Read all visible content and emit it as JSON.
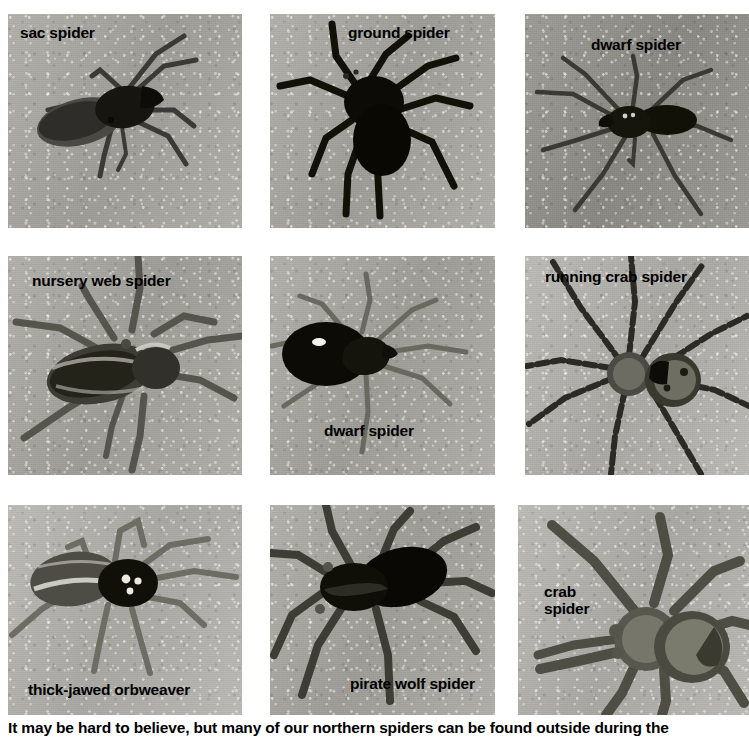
{
  "page": {
    "kind": "photo-plate",
    "background_color": "#ffffff",
    "grid_rows": 3,
    "grid_cols": 3
  },
  "caption": {
    "text": "It may be hard to believe, but many of our northern spiders can be found outside during the"
  },
  "panels": [
    {
      "id": "sac-spider",
      "label": "sac spider",
      "label_lines": [
        "sac spider"
      ],
      "row": 1,
      "col": 1,
      "label_position": "top-left",
      "tone": "mid"
    },
    {
      "id": "ground-spider",
      "label": "ground spider",
      "label_lines": [
        "ground spider"
      ],
      "row": 1,
      "col": 2,
      "label_position": "top-right",
      "tone": "mid"
    },
    {
      "id": "dwarf-spider-top",
      "label": "dwarf spider",
      "label_lines": [
        "dwarf spider"
      ],
      "row": 1,
      "col": 3,
      "label_position": "top-center",
      "tone": "dark"
    },
    {
      "id": "nursery-web-spider",
      "label": "nursery web spider",
      "label_lines": [
        "nursery web spider"
      ],
      "row": 2,
      "col": 1,
      "label_position": "top-left",
      "tone": "mid"
    },
    {
      "id": "dwarf-spider-middle",
      "label": "dwarf spider",
      "label_lines": [
        "dwarf spider"
      ],
      "row": 2,
      "col": 2,
      "label_position": "bottom-center",
      "tone": "mid"
    },
    {
      "id": "running-crab-spider",
      "label": "running crab spider",
      "label_lines": [
        "running crab spider"
      ],
      "row": 2,
      "col": 3,
      "label_position": "top-center",
      "tone": "light"
    },
    {
      "id": "thick-jawed-orbweaver",
      "label": "thick-jawed orbweaver",
      "label_lines": [
        "thick-jawed orbweaver"
      ],
      "row": 3,
      "col": 1,
      "label_position": "bottom-left",
      "tone": "light"
    },
    {
      "id": "pirate-wolf-spider",
      "label": "pirate wolf spider",
      "label_lines": [
        "pirate wolf spider"
      ],
      "row": 3,
      "col": 2,
      "label_position": "bottom-right",
      "tone": "mid"
    },
    {
      "id": "crab-spider",
      "label": "crab spider",
      "label_lines": [
        "crab",
        "spider"
      ],
      "label_line1": "crab",
      "label_line2": "spider",
      "row": 3,
      "col": 3,
      "label_position": "left-middle",
      "tone": "light"
    }
  ]
}
